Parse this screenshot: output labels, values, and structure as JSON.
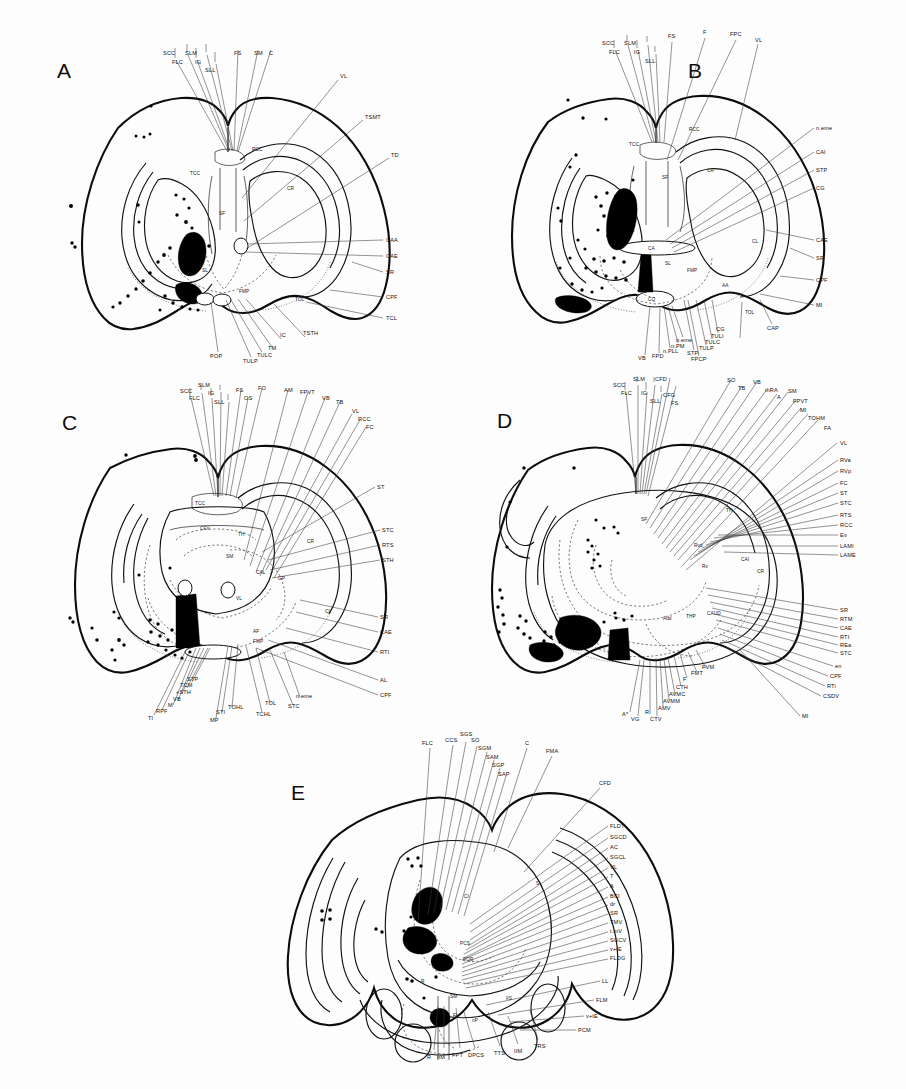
{
  "figure": {
    "background_color": "#fdfdfd",
    "ink_color": "#111111",
    "panel_letters": [
      "A",
      "B",
      "C",
      "D",
      "E"
    ]
  },
  "panels": [
    {
      "id": "A",
      "letter": "A",
      "labels_top": [
        "SCC",
        "SLM",
        "FLC",
        "IG",
        "SLL",
        "FS",
        "SM",
        "C"
      ],
      "labels_right": [
        "VL",
        "TSMT",
        "TD",
        "CAA",
        "CAE",
        "SR",
        "CPF",
        "TCL"
      ],
      "labels_bottom": [
        "POP",
        "TULP",
        "TULC",
        "TM",
        "IC",
        "TSTH"
      ],
      "labels_inside": [
        "TCC",
        "RCC",
        "CR",
        "SF",
        "SL",
        "FMP",
        "TOL"
      ]
    },
    {
      "id": "B",
      "letter": "B",
      "labels_top": [
        "SCC",
        "SLM",
        "FLC",
        "IG",
        "SLL",
        "FS",
        "F",
        "FPC",
        "VL"
      ],
      "labels_right": [
        "n.eme",
        "CAI",
        "STP",
        "CG",
        "CAE",
        "SR",
        "CPF",
        "MI"
      ],
      "labels_bottom": [
        "VB",
        "FPD",
        "n.PLL",
        "n.PM",
        "n.eme",
        "STP",
        "FPCP",
        "TULP",
        "TULC",
        "TULI",
        "CG",
        "CAP"
      ],
      "labels_inside": [
        "TCC",
        "RCC",
        "CA",
        "CR",
        "SF",
        "SL",
        "FMP",
        "CQ",
        "AA",
        "TOL",
        "CL"
      ]
    },
    {
      "id": "C",
      "letter": "C",
      "labels_top": [
        "SCC",
        "SLM",
        "FLC",
        "IG",
        "SLL",
        "FS",
        "OS",
        "FO",
        "AM",
        "FPVT",
        "VB",
        "TB"
      ],
      "labels_right": [
        "VL",
        "RCC",
        "FC",
        "ST",
        "STC",
        "RTS",
        "STH",
        "SR",
        "CAE",
        "RTI",
        "AL",
        "CPF"
      ],
      "labels_bottom": [
        "TI",
        "RPF",
        "M",
        "VB",
        "+STH",
        "TCM",
        "STP",
        "MP",
        "STI",
        "TOHL",
        "TCHL",
        "TOL",
        "STC",
        "n.eme"
      ],
      "labels_inside": [
        "TCC",
        "CFV",
        "TH",
        "CR",
        "CAL",
        "GP",
        "VL",
        "SM",
        "AF",
        "FMP",
        "CL"
      ]
    },
    {
      "id": "D",
      "letter": "D",
      "labels_top": [
        "SCC",
        "SLM",
        "CFD",
        "FLC",
        "IG",
        "SLL",
        "CFG",
        "FS",
        "SO",
        "TB",
        "VB",
        "mRA",
        "A",
        "SM",
        "FPVT",
        "MI",
        "TOHM",
        "FA"
      ],
      "labels_right": [
        "VL",
        "RVa",
        "RVp",
        "FC",
        "ST",
        "STC",
        "RTS",
        "RCC",
        "Ev",
        "LAMI",
        "LAME",
        "SR",
        "RTM",
        "CAE",
        "RTI",
        "REa",
        "STC",
        "en",
        "CPF",
        "RTi",
        "CSDV",
        "MI"
      ],
      "labels_bottom": [
        "A*",
        "VG",
        "RI",
        "CTV",
        "AMV",
        "AVMM",
        "AVMC",
        "CTH",
        "F",
        "FMT",
        "FVM"
      ],
      "labels_inside": [
        "SF",
        "TH",
        "CAI",
        "Rvd",
        "Rv",
        "Add",
        "THP",
        "CAUD",
        "CR"
      ]
    },
    {
      "id": "E",
      "letter": "E",
      "labels_top": [
        "FLC",
        "CCS",
        "SGS",
        "SO",
        "SGM",
        "SAM",
        "SGP",
        "SAP",
        "C",
        "FMA",
        "CFD"
      ],
      "labels_right": [
        "FLDT",
        "SGCD",
        "AC",
        "SGCL",
        "VL",
        "T",
        "A",
        "BCI",
        "dr",
        "SR",
        "TMV",
        "t.mV",
        "SGCV",
        "v+tE",
        "FLDG",
        "LL",
        "FLM",
        "v+tE",
        "PCM"
      ],
      "labels_bottom": [
        "R",
        "nM",
        "FPT",
        "DPCS",
        "TTS",
        "IIM",
        "TRS"
      ],
      "labels_inside": [
        "CI",
        "S",
        "PCS",
        "FOR",
        "FL",
        "IIS",
        "nP",
        "SM",
        "R"
      ]
    }
  ]
}
